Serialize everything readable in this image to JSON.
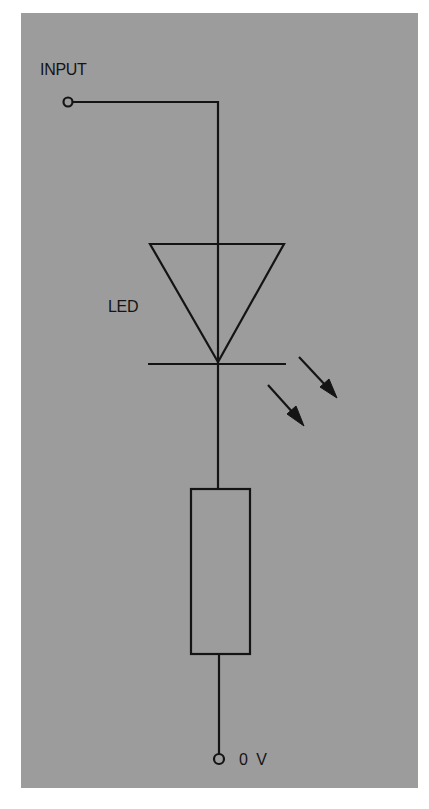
{
  "diagram": {
    "type": "circuit-schematic",
    "labels": {
      "input": "INPUT",
      "led": "LED",
      "ground": "0 V"
    },
    "components": [
      {
        "id": "input-terminal",
        "kind": "terminal"
      },
      {
        "id": "led",
        "kind": "light-emitting-diode",
        "label": "LED"
      },
      {
        "id": "resistor",
        "kind": "resistor"
      },
      {
        "id": "ground-terminal",
        "kind": "terminal",
        "label": "0 V"
      }
    ],
    "colors": {
      "background": "#9c9c9c",
      "stroke": "#141414"
    }
  }
}
